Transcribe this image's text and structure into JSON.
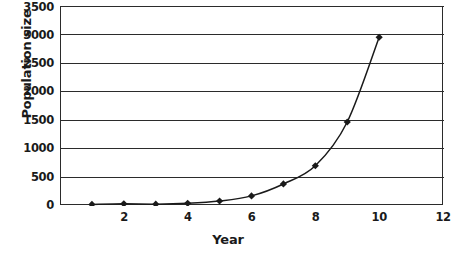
{
  "chart_data": {
    "type": "line",
    "title": "",
    "xlabel": "Year",
    "ylabel": "Population size",
    "xlim": [
      0,
      12
    ],
    "ylim": [
      0,
      3500
    ],
    "grid": true,
    "legend": false,
    "marker": "diamond",
    "line_color": "#1a1a1a",
    "marker_color": "#1a1a1a",
    "grid_color": "#2b2b2b",
    "x_ticks": [
      "2",
      "4",
      "6",
      "8",
      "10",
      "12"
    ],
    "x_tick_values": [
      2,
      4,
      6,
      8,
      10,
      12
    ],
    "y_ticks": [
      "0",
      "500",
      "1000",
      "1500",
      "2000",
      "2500",
      "3000",
      "3500"
    ],
    "y_tick_values": [
      0,
      500,
      1000,
      1500,
      2000,
      2500,
      3000,
      3500
    ],
    "x": [
      1,
      2,
      3,
      4,
      5,
      6,
      7,
      8,
      9,
      10
    ],
    "values": [
      10,
      20,
      15,
      30,
      70,
      160,
      370,
      690,
      1460,
      2950
    ],
    "series": [
      {
        "name": "Population size",
        "x": [
          1,
          2,
          3,
          4,
          5,
          6,
          7,
          8,
          9,
          10
        ],
        "values": [
          10,
          20,
          15,
          30,
          70,
          160,
          370,
          690,
          1460,
          2950
        ]
      }
    ]
  },
  "axes": {
    "y_title": "Population size",
    "x_title": "Year"
  }
}
